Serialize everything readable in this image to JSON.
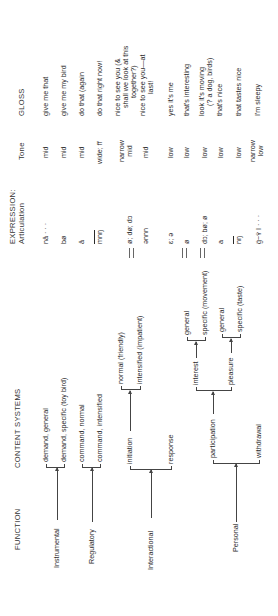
{
  "headers": {
    "function": "FUNCTION",
    "content_systems": "CONTENT SYSTEMS",
    "expression": "EXPRESSION:",
    "articulation": "Articulation",
    "tone": "Tone",
    "gloss": "GLOSS"
  },
  "functions": {
    "instrumental": "Instrumental",
    "regulatory": "Regulatory",
    "interactional": "Interactional",
    "personal": "Personal"
  },
  "content": {
    "demand_general": "demand, general",
    "demand_specific": "demand, specific (toy bird)",
    "command_normal": "command, normal",
    "command_intensified": "command, intensified",
    "initiation": "initiation",
    "normal_friendly": "normal (friendly)",
    "intensified_impatient": "intensified (impatient)",
    "response": "response",
    "participation": "participation",
    "interest": "interest",
    "interest_general": "general",
    "interest_specific": "specific (movement)",
    "pleasure": "pleasure",
    "pleasure_general": "general",
    "pleasure_specific": "specific (taste)",
    "withdrawal": "withdrawal"
  },
  "rows": [
    {
      "articulation": "nā · · ·",
      "tone": "mid",
      "gloss": [
        "give me that"
      ]
    },
    {
      "articulation": "bø",
      "tone": "mid",
      "gloss": [
        "give me my bird"
      ]
    },
    {
      "articulation": "ā",
      "tone": "mid",
      "gloss": [
        "do that (again"
      ]
    },
    {
      "articulation": "mnŋ",
      "tone": "wide; ff",
      "gloss": [
        "do that right now!"
      ]
    },
    {
      "articulation": "ø; dø; dɔ",
      "tone": [
        "narrow",
        "mid"
      ],
      "gloss": [
        "nice to see you (&",
        "shall we look at this",
        "together?)"
      ]
    },
    {
      "articulation": "ənnn",
      "tone": "mid",
      "gloss": [
        "nice to see you—at",
        "last!"
      ]
    },
    {
      "articulation": "ɛ; ə",
      "tone": "low",
      "gloss": [
        "yes it's me"
      ]
    },
    {
      "articulation": "ø",
      "tone": "low",
      "gloss": [
        "that's interesting"
      ]
    },
    {
      "articulation": "dɔ; bø; ø",
      "tone": "low",
      "gloss": [
        "look it's moving",
        "(? a dog, birds)"
      ]
    },
    {
      "articulation": "a",
      "tone": "low",
      "gloss": [
        "that's nice"
      ]
    },
    {
      "articulation": "nŋ",
      "tone": "low",
      "gloss": [
        "that tastes nice"
      ]
    },
    {
      "articulation": "g̈~ʏ̈ I · · ·",
      "tone": [
        "narrow",
        "low"
      ],
      "gloss": [
        "I'm sleepy"
      ]
    }
  ]
}
